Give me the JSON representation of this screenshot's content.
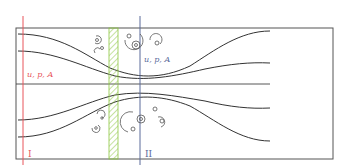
{
  "diagram": {
    "type": "flow-through-pipe-with-sudden-contraction-and-expansion",
    "labels": {
      "section1_vars": "u, p, A",
      "section2_vars": "u, p, A",
      "section1_name": "I",
      "section2_name": "II"
    },
    "colors": {
      "outline": "#555555",
      "streamline": "#333333",
      "section1": "#e8555a",
      "section2": "#5a6a9a",
      "hatch": "#8cc63f",
      "eddy": "#555555"
    }
  }
}
